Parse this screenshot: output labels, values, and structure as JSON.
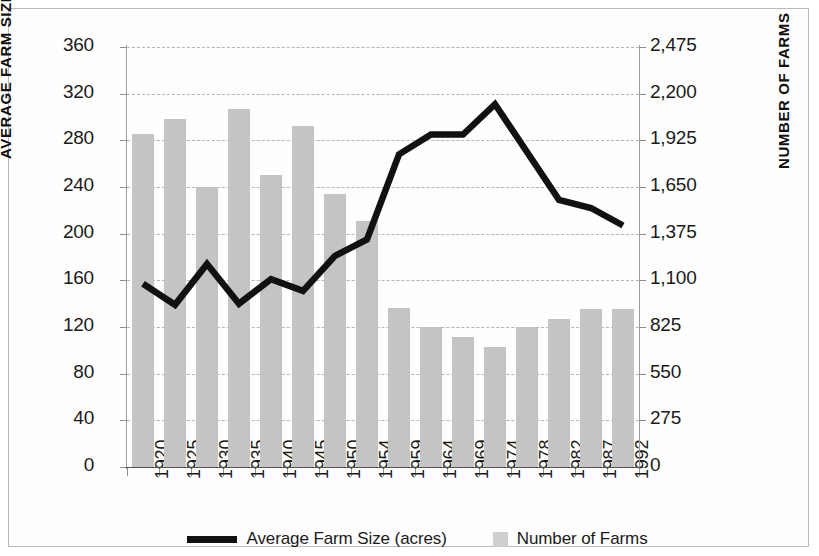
{
  "chart_data": {
    "type": "bar",
    "title": "",
    "subtitle": "",
    "xlabel": "",
    "ylabel": "AVERAGE FARM SIZE (ACRES)",
    "y2label": "NUMBER OF FARMS",
    "grid": true,
    "legend_position": "bottom-center",
    "categories": [
      "1920",
      "1925",
      "1930",
      "1935",
      "1940",
      "1945",
      "1950",
      "1954",
      "1959",
      "1964",
      "1969",
      "1974",
      "1978",
      "1982",
      "1987",
      "1992"
    ],
    "ylim": [
      0,
      360
    ],
    "y2lim": [
      0,
      2475
    ],
    "yticks": [
      "0",
      "40",
      "80",
      "120",
      "160",
      "200",
      "240",
      "280",
      "320",
      "360"
    ],
    "ytick_values": [
      0,
      40,
      80,
      120,
      160,
      200,
      240,
      280,
      320,
      360
    ],
    "y2ticks": [
      "0",
      "275",
      "550",
      "825",
      "1,100",
      "1,375",
      "1,650",
      "1,925",
      "2,200",
      "2,475"
    ],
    "y2tick_values": [
      0,
      275,
      550,
      825,
      1100,
      1375,
      1650,
      1925,
      2200,
      2475
    ],
    "series": [
      {
        "name": "Number of Farms",
        "type": "bar",
        "axis": "right",
        "color": "#c4c4c4",
        "values": [
          1960,
          2050,
          1650,
          2110,
          1720,
          2010,
          1610,
          1450,
          935,
          825,
          765,
          705,
          825,
          875,
          930,
          930
        ]
      },
      {
        "name": "Average Farm Size (acres)",
        "type": "line",
        "axis": "left",
        "color": "#111111",
        "values": [
          157,
          139,
          174,
          140,
          161,
          151,
          181,
          195,
          268,
          285,
          285,
          311,
          270,
          229,
          222,
          207
        ]
      }
    ]
  },
  "legend": {
    "items": [
      {
        "label": "Average Farm Size (acres)",
        "marker": "line",
        "color": "#111111"
      },
      {
        "label": "Number of Farms",
        "marker": "swatch",
        "color": "#cfcfcf"
      }
    ]
  },
  "axes": {
    "left_title": "AVERAGE FARM SIZE (ACRES)",
    "right_title": "NUMBER OF FARMS"
  }
}
